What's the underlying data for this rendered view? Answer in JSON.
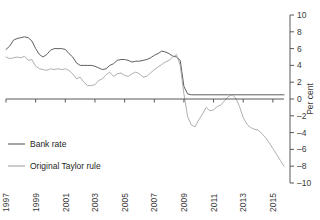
{
  "chart_data": {
    "type": "line",
    "title": "",
    "xlabel": "",
    "ylabel": "Per cent",
    "ylim": [
      -10,
      10
    ],
    "xlim": [
      1997,
      2015.75
    ],
    "grid": false,
    "legend_position": "lower-left",
    "yticks": [
      -10,
      -8,
      -6,
      -4,
      -2,
      0,
      2,
      4,
      6,
      8,
      10
    ],
    "ytick_labels": [
      "–10",
      "–8",
      "–6",
      "–4",
      "–2",
      "0",
      "2",
      "4",
      "6",
      "8",
      "10"
    ],
    "xticks": [
      1997,
      1999,
      2001,
      2003,
      2005,
      2007,
      2009,
      2011,
      2013,
      2015
    ],
    "xtick_labels": [
      "1997",
      "1999",
      "2001",
      "2003",
      "2005",
      "2007",
      "2009",
      "2011",
      "2013",
      "2015"
    ],
    "zero_line": 0,
    "series": [
      {
        "name": "Bank rate",
        "color": "#4d4d4d",
        "x": [
          1997.0,
          1997.25,
          1997.5,
          1997.75,
          1998.0,
          1998.25,
          1998.5,
          1998.75,
          1999.0,
          1999.25,
          1999.5,
          1999.75,
          2000.0,
          2000.25,
          2000.5,
          2000.75,
          2001.0,
          2001.25,
          2001.5,
          2001.75,
          2002.0,
          2002.25,
          2002.5,
          2002.75,
          2003.0,
          2003.25,
          2003.5,
          2003.75,
          2004.0,
          2004.25,
          2004.5,
          2004.75,
          2005.0,
          2005.25,
          2005.5,
          2005.75,
          2006.0,
          2006.25,
          2006.5,
          2006.75,
          2007.0,
          2007.25,
          2007.5,
          2007.75,
          2008.0,
          2008.25,
          2008.5,
          2008.75,
          2009.0,
          2009.25,
          2009.5,
          2009.75,
          2010.0,
          2011.0,
          2012.0,
          2013.0,
          2014.0,
          2015.0,
          2015.75
        ],
        "values": [
          5.9,
          6.3,
          7.0,
          7.2,
          7.3,
          7.4,
          7.3,
          6.9,
          6.0,
          5.3,
          5.0,
          5.3,
          5.8,
          6.0,
          6.0,
          6.0,
          5.9,
          5.4,
          5.0,
          4.3,
          4.0,
          4.0,
          4.0,
          4.0,
          3.9,
          3.7,
          3.5,
          3.6,
          4.0,
          4.2,
          4.6,
          4.7,
          4.7,
          4.6,
          4.4,
          4.5,
          4.5,
          4.6,
          4.7,
          4.9,
          5.2,
          5.4,
          5.7,
          5.6,
          5.4,
          5.1,
          5.0,
          4.6,
          1.5,
          0.6,
          0.5,
          0.5,
          0.5,
          0.5,
          0.5,
          0.5,
          0.5,
          0.5,
          0.5
        ]
      },
      {
        "name": "Original Taylor rule",
        "color": "#9a9a9a",
        "x": [
          1997.0,
          1997.25,
          1997.5,
          1997.75,
          1998.0,
          1998.25,
          1998.5,
          1998.75,
          1999.0,
          1999.25,
          1999.5,
          1999.75,
          2000.0,
          2000.25,
          2000.5,
          2000.75,
          2001.0,
          2001.25,
          2001.5,
          2001.75,
          2002.0,
          2002.25,
          2002.5,
          2002.75,
          2003.0,
          2003.25,
          2003.5,
          2003.75,
          2004.0,
          2004.25,
          2004.5,
          2004.75,
          2005.0,
          2005.25,
          2005.5,
          2005.75,
          2006.0,
          2006.25,
          2006.5,
          2006.75,
          2007.0,
          2007.25,
          2007.5,
          2007.75,
          2008.0,
          2008.25,
          2008.5,
          2008.75,
          2009.0,
          2009.25,
          2009.5,
          2009.75,
          2010.0,
          2010.25,
          2010.5,
          2010.75,
          2011.0,
          2011.25,
          2011.5,
          2011.75,
          2012.0,
          2012.25,
          2012.5,
          2012.75,
          2013.0,
          2013.25,
          2013.5,
          2013.75,
          2014.0,
          2014.25,
          2014.5,
          2014.75,
          2015.0,
          2015.25,
          2015.5,
          2015.75
        ],
        "values": [
          5.0,
          4.8,
          4.9,
          5.0,
          4.9,
          5.1,
          4.6,
          4.7,
          3.9,
          3.6,
          3.5,
          3.4,
          3.6,
          3.5,
          3.6,
          3.5,
          3.6,
          3.4,
          3.0,
          2.4,
          2.6,
          2.0,
          1.6,
          1.6,
          1.7,
          2.2,
          2.4,
          2.9,
          3.2,
          2.7,
          3.0,
          3.1,
          2.8,
          2.7,
          3.0,
          3.2,
          3.0,
          2.6,
          2.7,
          3.1,
          3.5,
          3.8,
          4.1,
          4.4,
          4.6,
          5.0,
          5.3,
          4.0,
          0.6,
          -2.1,
          -3.1,
          -3.3,
          -2.5,
          -1.8,
          -1.0,
          -1.4,
          -1.3,
          -0.9,
          -0.7,
          -0.2,
          0.3,
          0.5,
          0.1,
          -0.9,
          -2.2,
          -3.0,
          -3.4,
          -3.6,
          -3.7,
          -4.1,
          -4.6,
          -5.2,
          -5.9,
          -6.6,
          -7.3,
          -8.0
        ]
      }
    ]
  },
  "axis": {
    "y_axis_title": "Per cent"
  },
  "legend": {
    "items": [
      {
        "label": "Bank rate",
        "color": "#4d4d4d"
      },
      {
        "label": "Original Taylor rule",
        "color": "#9a9a9a"
      }
    ]
  }
}
